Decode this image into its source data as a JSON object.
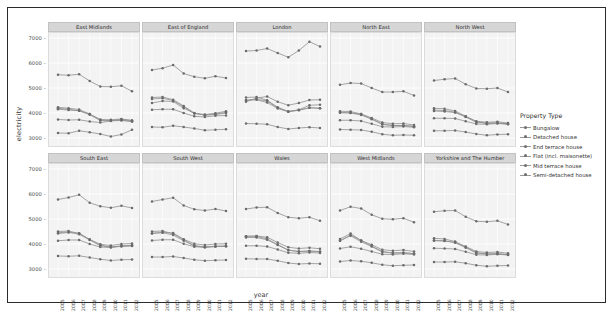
{
  "axes": {
    "ylabel": "electricity",
    "xlabel": "year",
    "yticks": [
      "7000",
      "6000",
      "5000",
      "4000",
      "3000"
    ],
    "ylim": [
      2600,
      7200
    ],
    "xticks": [
      "2005",
      "2006",
      "2007",
      "2008",
      "2009",
      "2010",
      "2011",
      "2012"
    ]
  },
  "legend": {
    "title": "Property Type",
    "items": [
      {
        "label": "Bungalow",
        "color": "#7f7f7f"
      },
      {
        "label": "Detached house",
        "color": "#7f7f7f"
      },
      {
        "label": "End terrace house",
        "color": "#7f7f7f"
      },
      {
        "label": "Flat (incl. maisonette)",
        "color": "#7f7f7f"
      },
      {
        "label": "Mid terrace house",
        "color": "#7f7f7f"
      },
      {
        "label": "Semi-detached house",
        "color": "#7f7f7f"
      }
    ]
  },
  "chart_data": {
    "type": "line",
    "title": "",
    "xlabel": "year",
    "ylabel": "electricity",
    "ylim": [
      2600,
      7200
    ],
    "grid": true,
    "legend_position": "right",
    "legend_title": "Property Type",
    "x": [
      2005,
      2006,
      2007,
      2008,
      2009,
      2010,
      2011,
      2012
    ],
    "facet_rows": 2,
    "facet_cols": 5,
    "facets": [
      {
        "name": "East Midlands",
        "series": [
          {
            "name": "Bungalow",
            "values": [
              4190,
              4150,
              4090,
              3960,
              3730,
              3730,
              3760,
              3700
            ]
          },
          {
            "name": "Detached house",
            "values": [
              5530,
              5510,
              5550,
              5280,
              5060,
              5050,
              5090,
              4870
            ]
          },
          {
            "name": "End terrace house",
            "values": [
              4150,
              4120,
              4090,
              3930,
              3700,
              3690,
              3700,
              3660
            ]
          },
          {
            "name": "Flat (incl. maisonette)",
            "values": [
              3200,
              3190,
              3290,
              3230,
              3160,
              3060,
              3140,
              3330
            ]
          },
          {
            "name": "Mid terrace house",
            "values": [
              4230,
              4190,
              4140,
              3960,
              3730,
              3700,
              3720,
              3660
            ]
          },
          {
            "name": "Semi-detached house",
            "values": [
              3740,
              3720,
              3730,
              3660,
              3620,
              3680,
              3750,
              3700
            ]
          }
        ]
      },
      {
        "name": "East of England",
        "series": [
          {
            "name": "Bungalow",
            "values": [
              4400,
              4480,
              4460,
              4190,
              3990,
              3940,
              3990,
              4070
            ]
          },
          {
            "name": "Detached house",
            "values": [
              5720,
              5790,
              5920,
              5580,
              5450,
              5390,
              5470,
              5400
            ]
          },
          {
            "name": "End terrace house",
            "values": [
              4560,
              4590,
              4500,
              4250,
              3980,
              3920,
              3960,
              4020
            ]
          },
          {
            "name": "Flat (incl. maisonette)",
            "values": [
              3440,
              3430,
              3490,
              3440,
              3380,
              3310,
              3330,
              3350
            ]
          },
          {
            "name": "Mid terrace house",
            "values": [
              4620,
              4640,
              4530,
              4280,
              4000,
              3910,
              3940,
              4000
            ]
          },
          {
            "name": "Semi-detached house",
            "values": [
              4130,
              4150,
              4150,
              4000,
              3870,
              3840,
              3890,
              3900
            ]
          }
        ]
      },
      {
        "name": "London",
        "series": [
          {
            "name": "Bungalow",
            "values": [
              4520,
              4550,
              4480,
              4210,
              4060,
              4130,
              4310,
              4330
            ]
          },
          {
            "name": "Detached house",
            "values": [
              6480,
              6500,
              6580,
              6400,
              6230,
              6500,
              6850,
              6660
            ]
          },
          {
            "name": "End terrace house",
            "values": [
              4500,
              4530,
              4420,
              4180,
              4050,
              4110,
              4210,
              4190
            ]
          },
          {
            "name": "Flat (incl. maisonette)",
            "values": [
              3580,
              3570,
              3550,
              3440,
              3360,
              3400,
              3430,
              3400
            ]
          },
          {
            "name": "Mid terrace house",
            "values": [
              4620,
              4640,
              4510,
              4230,
              4060,
              4120,
              4210,
              4190
            ]
          },
          {
            "name": "Semi-detached house",
            "values": [
              4450,
              4600,
              4660,
              4450,
              4310,
              4400,
              4520,
              4530
            ]
          }
        ]
      },
      {
        "name": "North East",
        "series": [
          {
            "name": "Bungalow",
            "values": [
              4020,
              4010,
              3960,
              3800,
              3620,
              3570,
              3580,
              3520
            ]
          },
          {
            "name": "Detached house",
            "values": [
              5130,
              5200,
              5180,
              5000,
              4840,
              4840,
              4870,
              4700
            ]
          },
          {
            "name": "End terrace house",
            "values": [
              4010,
              4000,
              3920,
              3750,
              3540,
              3500,
              3500,
              3470
            ]
          },
          {
            "name": "Flat (incl. maisonette)",
            "values": [
              3340,
              3330,
              3320,
              3250,
              3150,
              3110,
              3120,
              3110
            ]
          },
          {
            "name": "Mid terrace house",
            "values": [
              4070,
              4060,
              3960,
              3770,
              3560,
              3500,
              3500,
              3460
            ]
          },
          {
            "name": "Semi-detached house",
            "values": [
              3710,
              3710,
              3680,
              3570,
              3450,
              3440,
              3460,
              3430
            ]
          }
        ]
      },
      {
        "name": "North West",
        "series": [
          {
            "name": "Bungalow",
            "values": [
              4080,
              4060,
              4020,
              3860,
              3670,
              3630,
              3650,
              3600
            ]
          },
          {
            "name": "Detached house",
            "values": [
              5300,
              5350,
              5380,
              5150,
              4980,
              4970,
              5000,
              4840
            ]
          },
          {
            "name": "End terrace house",
            "values": [
              4120,
              4100,
              4030,
              3840,
              3630,
              3590,
              3600,
              3570
            ]
          },
          {
            "name": "Flat (incl. maisonette)",
            "values": [
              3290,
              3290,
              3300,
              3240,
              3160,
              3110,
              3140,
              3150
            ]
          },
          {
            "name": "Mid terrace house",
            "values": [
              4190,
              4170,
              4080,
              3870,
              3650,
              3590,
              3600,
              3560
            ]
          },
          {
            "name": "Semi-detached house",
            "values": [
              3790,
              3790,
              3780,
              3670,
              3560,
              3550,
              3580,
              3550
            ]
          }
        ]
      },
      {
        "name": "South East",
        "series": [
          {
            "name": "Bungalow",
            "values": [
              4420,
              4460,
              4430,
              4180,
              3990,
              3940,
              4000,
              4020
            ]
          },
          {
            "name": "Detached house",
            "values": [
              5780,
              5860,
              5970,
              5650,
              5510,
              5450,
              5530,
              5440
            ]
          },
          {
            "name": "End terrace house",
            "values": [
              4450,
              4480,
              4390,
              4160,
              3930,
              3880,
              3920,
              3950
            ]
          },
          {
            "name": "Flat (incl. maisonette)",
            "values": [
              3520,
              3510,
              3530,
              3460,
              3390,
              3340,
              3370,
              3380
            ]
          },
          {
            "name": "Mid terrace house",
            "values": [
              4500,
              4520,
              4420,
              4180,
              3950,
              3880,
              3910,
              3940
            ]
          },
          {
            "name": "Semi-detached house",
            "values": [
              4130,
              4160,
              4160,
              4000,
              3880,
              3860,
              3910,
              3920
            ]
          }
        ]
      },
      {
        "name": "South West",
        "series": [
          {
            "name": "Bungalow",
            "values": [
              4430,
              4470,
              4440,
              4190,
              4010,
              3960,
              4000,
              4010
            ]
          },
          {
            "name": "Detached house",
            "values": [
              5700,
              5780,
              5850,
              5540,
              5390,
              5340,
              5400,
              5320
            ]
          },
          {
            "name": "End terrace house",
            "values": [
              4420,
              4450,
              4360,
              4130,
              3920,
              3870,
              3900,
              3920
            ]
          },
          {
            "name": "Flat (incl. maisonette)",
            "values": [
              3480,
              3480,
              3500,
              3440,
              3370,
              3330,
              3350,
              3360
            ]
          },
          {
            "name": "Mid terrace house",
            "values": [
              4500,
              4520,
              4410,
              4170,
              3940,
              3880,
              3900,
              3910
            ]
          },
          {
            "name": "Semi-detached house",
            "values": [
              4140,
              4170,
              4170,
              4010,
              3890,
              3870,
              3910,
              3910
            ]
          }
        ]
      },
      {
        "name": "Wales",
        "series": [
          {
            "name": "Bungalow",
            "values": [
              4310,
              4320,
              4270,
              4060,
              3870,
              3820,
              3850,
              3810
            ]
          },
          {
            "name": "Detached house",
            "values": [
              5400,
              5460,
              5470,
              5240,
              5070,
              5030,
              5070,
              4930
            ]
          },
          {
            "name": "End terrace house",
            "values": [
              4260,
              4260,
              4170,
              3960,
              3750,
              3700,
              3720,
              3700
            ]
          },
          {
            "name": "Flat (incl. maisonette)",
            "values": [
              3410,
              3400,
              3400,
              3330,
              3240,
              3200,
              3220,
              3210
            ]
          },
          {
            "name": "Mid terrace house",
            "values": [
              4310,
              4310,
              4200,
              3980,
              3760,
              3700,
              3720,
              3690
            ]
          },
          {
            "name": "Semi-detached house",
            "values": [
              3930,
              3930,
              3900,
              3780,
              3650,
              3630,
              3660,
              3640
            ]
          }
        ]
      },
      {
        "name": "West Midlands",
        "series": [
          {
            "name": "Bungalow",
            "values": [
              4130,
              4360,
              4140,
              3970,
              3770,
              3730,
              3760,
              3700
            ]
          },
          {
            "name": "Detached house",
            "values": [
              5340,
              5490,
              5420,
              5170,
              5010,
              4990,
              5030,
              4870
            ]
          },
          {
            "name": "End terrace house",
            "values": [
              4130,
              4330,
              4090,
              3900,
              3680,
              3640,
              3650,
              3620
            ]
          },
          {
            "name": "Flat (incl. maisonette)",
            "values": [
              3300,
              3340,
              3310,
              3250,
              3170,
              3130,
              3150,
              3160
            ]
          },
          {
            "name": "Mid terrace house",
            "values": [
              4200,
              4420,
              4140,
              3920,
              3700,
              3640,
              3650,
              3610
            ]
          },
          {
            "name": "Semi-detached house",
            "values": [
              3820,
              3890,
              3810,
              3700,
              3590,
              3580,
              3610,
              3580
            ]
          }
        ]
      },
      {
        "name": "Yorkshire and The Humber",
        "series": [
          {
            "name": "Bungalow",
            "values": [
              4130,
              4120,
              4070,
              3900,
              3700,
              3660,
              3680,
              3630
            ]
          },
          {
            "name": "Detached house",
            "values": [
              5290,
              5330,
              5340,
              5090,
              4910,
              4890,
              4930,
              4780
            ]
          },
          {
            "name": "End terrace house",
            "values": [
              4150,
              4130,
              4050,
              3850,
              3640,
              3600,
              3610,
              3580
            ]
          },
          {
            "name": "Flat (incl. maisonette)",
            "values": [
              3280,
              3280,
              3290,
              3230,
              3150,
              3110,
              3130,
              3140
            ]
          },
          {
            "name": "Mid terrace house",
            "values": [
              4230,
              4200,
              4100,
              3880,
              3650,
              3600,
              3610,
              3570
            ]
          },
          {
            "name": "Semi-detached house",
            "values": [
              3830,
              3820,
              3800,
              3690,
              3570,
              3560,
              3590,
              3560
            ]
          }
        ]
      }
    ]
  }
}
